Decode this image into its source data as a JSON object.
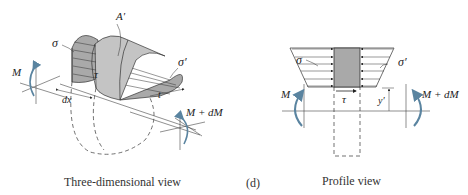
{
  "figure": {
    "label": "(d)",
    "colors": {
      "shade": "#a9a9a9",
      "shade_light": "#c4c4c4",
      "line": "#333333",
      "moment_arrow": "#5a84a0"
    }
  },
  "three_d_view": {
    "caption": "Three-dimensional view",
    "labels": {
      "sigma": "σ",
      "sigma_prime": "σ′",
      "area": "A′",
      "tau": "τ",
      "moment_left": "M",
      "moment_right": "M + dM",
      "dx": "dx",
      "t": "t"
    }
  },
  "profile_view": {
    "caption": "Profile view",
    "labels": {
      "sigma": "σ",
      "sigma_prime": "σ′",
      "tau": "τ",
      "moment_left": "M",
      "moment_right": "M + dM",
      "y_prime": "y′"
    }
  }
}
